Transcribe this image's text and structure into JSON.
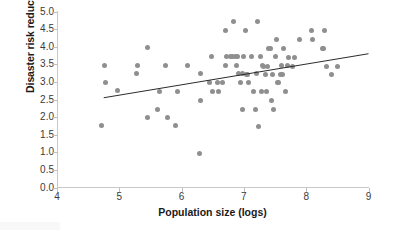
{
  "chart_data": {
    "type": "scatter",
    "title": "",
    "xlabel": "Population size (logs)",
    "ylabel": "Disaster risk reduction score",
    "xlim": [
      4,
      9
    ],
    "ylim": [
      0.0,
      5.0
    ],
    "xticks": [
      "4",
      "5",
      "6",
      "7",
      "8",
      "9"
    ],
    "yticks": [
      "0.0",
      "0.5",
      "1.0",
      "1.5",
      "2.0",
      "2.5",
      "3.0",
      "3.5",
      "4.0",
      "4.5",
      "5.0"
    ],
    "grid": false,
    "legend": null,
    "marker_color": "#8f8f8f",
    "trendline_color": "#2b2b2b",
    "axis_color": "#c9c9c9",
    "trendline": {
      "x0": 4.75,
      "y0": 2.55,
      "x1": 9.0,
      "y1": 3.8
    },
    "points": [
      [
        4.72,
        1.75
      ],
      [
        4.76,
        3.48
      ],
      [
        4.78,
        2.98
      ],
      [
        4.97,
        2.75
      ],
      [
        5.28,
        3.25
      ],
      [
        5.3,
        3.48
      ],
      [
        5.45,
        3.97
      ],
      [
        5.46,
        2.0
      ],
      [
        5.62,
        2.23
      ],
      [
        5.64,
        2.73
      ],
      [
        5.74,
        3.48
      ],
      [
        5.77,
        2.0
      ],
      [
        5.9,
        1.75
      ],
      [
        5.93,
        2.73
      ],
      [
        6.1,
        3.48
      ],
      [
        6.28,
        0.97
      ],
      [
        6.3,
        2.48
      ],
      [
        6.31,
        3.23
      ],
      [
        6.45,
        2.98
      ],
      [
        6.48,
        3.72
      ],
      [
        6.5,
        2.73
      ],
      [
        6.58,
        2.98
      ],
      [
        6.6,
        2.73
      ],
      [
        6.65,
        2.98
      ],
      [
        6.7,
        3.48
      ],
      [
        6.71,
        4.47
      ],
      [
        6.72,
        3.72
      ],
      [
        6.78,
        3.72
      ],
      [
        6.82,
        3.72
      ],
      [
        6.84,
        4.72
      ],
      [
        6.86,
        3.72
      ],
      [
        6.88,
        3.48
      ],
      [
        6.9,
        3.72
      ],
      [
        6.92,
        3.23
      ],
      [
        6.95,
        2.98
      ],
      [
        6.97,
        3.23
      ],
      [
        6.98,
        2.23
      ],
      [
        7.0,
        3.72
      ],
      [
        7.02,
        4.47
      ],
      [
        7.04,
        3.22
      ],
      [
        7.06,
        3.22
      ],
      [
        7.08,
        2.98
      ],
      [
        7.12,
        3.72
      ],
      [
        7.16,
        2.73
      ],
      [
        7.18,
        2.23
      ],
      [
        7.2,
        3.23
      ],
      [
        7.22,
        4.72
      ],
      [
        7.24,
        1.73
      ],
      [
        7.26,
        3.72
      ],
      [
        7.28,
        2.73
      ],
      [
        7.3,
        3.48
      ],
      [
        7.32,
        3.45
      ],
      [
        7.34,
        3.22
      ],
      [
        7.36,
        2.73
      ],
      [
        7.38,
        3.45
      ],
      [
        7.4,
        3.95
      ],
      [
        7.42,
        3.95
      ],
      [
        7.44,
        2.47
      ],
      [
        7.46,
        3.22
      ],
      [
        7.48,
        2.23
      ],
      [
        7.5,
        3.72
      ],
      [
        7.52,
        4.2
      ],
      [
        7.54,
        2.98
      ],
      [
        7.56,
        2.97
      ],
      [
        7.58,
        3.22
      ],
      [
        7.6,
        3.48
      ],
      [
        7.62,
        3.22
      ],
      [
        7.64,
        3.95
      ],
      [
        7.66,
        2.73
      ],
      [
        7.7,
        3.48
      ],
      [
        7.72,
        3.7
      ],
      [
        7.78,
        3.45
      ],
      [
        7.82,
        3.7
      ],
      [
        7.9,
        4.2
      ],
      [
        8.08,
        4.45
      ],
      [
        8.1,
        4.2
      ],
      [
        8.26,
        3.95
      ],
      [
        8.28,
        3.95
      ],
      [
        8.3,
        4.45
      ],
      [
        8.32,
        3.43
      ],
      [
        8.4,
        3.2
      ],
      [
        8.5,
        3.45
      ]
    ]
  }
}
